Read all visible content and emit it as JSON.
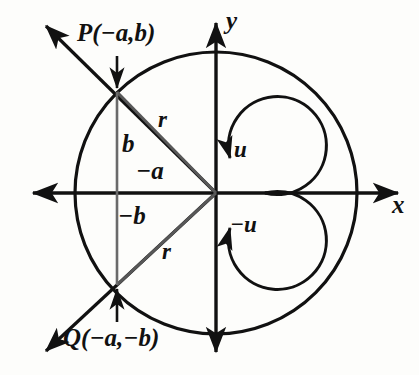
{
  "figure": {
    "stroke_color": "#111111",
    "chord_color": "#4a4a4a",
    "background": "#fdfdfb"
  },
  "axes": {
    "x_label": "x",
    "y_label": "y",
    "origin": {
      "x": 216,
      "y": 193
    }
  },
  "circle": {
    "center": {
      "x": 216,
      "y": 193
    },
    "radius": 141
  },
  "points": [
    {
      "id": "P",
      "label": "P(−a,b)",
      "x": 117,
      "y": 92
    },
    {
      "id": "Q",
      "label": "Q(−a,−b)",
      "x": 117,
      "y": 285
    }
  ],
  "segments": [
    {
      "id": "b_positive",
      "label": "b"
    },
    {
      "id": "a_negative",
      "label": "−a"
    },
    {
      "id": "b_negative",
      "label": "−b"
    },
    {
      "id": "radius_upper",
      "label": "r"
    },
    {
      "id": "radius_lower",
      "label": "r"
    }
  ],
  "angles": [
    {
      "id": "u_positive",
      "label": "u",
      "direction": "counterclockwise"
    },
    {
      "id": "u_negative",
      "label": "−u",
      "direction": "clockwise"
    }
  ],
  "icons": {
    "arrow_x_positive": "arrow-right-icon",
    "arrow_x_negative": "arrow-left-icon",
    "arrow_y_positive": "arrow-up-icon",
    "arrow_y_negative": "arrow-down-icon",
    "arrow_ray_upper": "arrow-upleft-icon",
    "arrow_ray_lower": "arrow-downleft-icon",
    "pointer_to_P": "arrow-down-pointer-icon",
    "pointer_to_Q": "arrow-up-pointer-icon"
  }
}
